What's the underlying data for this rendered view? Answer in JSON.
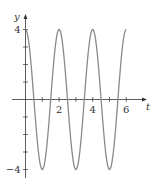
{
  "chart_data": {
    "type": "line",
    "title": "",
    "xlabel": "t",
    "ylabel": "y",
    "function": "y = 4cos(πt)",
    "xlim": [
      0,
      6
    ],
    "ylim": [
      -4,
      4
    ],
    "x_ticks": [
      1,
      2,
      3,
      4,
      5,
      6
    ],
    "x_tick_labels": [
      "",
      "2",
      "",
      "4",
      "",
      "6"
    ],
    "y_ticks": [
      -4,
      -3,
      -2,
      -1,
      1,
      2,
      3,
      4
    ],
    "y_tick_labels": [
      "−4",
      "",
      "",
      "",
      "",
      "",
      "",
      "4"
    ],
    "grid": false,
    "legend": null,
    "series": [
      {
        "name": "y(t)",
        "x": [
          0,
          0.5,
          1,
          1.5,
          2,
          2.5,
          3,
          3.5,
          4,
          4.5,
          5,
          5.5,
          6
        ],
        "values": [
          4,
          0,
          -4,
          0,
          4,
          0,
          -4,
          0,
          4,
          0,
          -4,
          0,
          4
        ]
      }
    ],
    "colors": {
      "curve": "#8a8a8a",
      "axis": "#333333"
    }
  },
  "axes": {
    "x_label": "t",
    "y_label": "y"
  }
}
